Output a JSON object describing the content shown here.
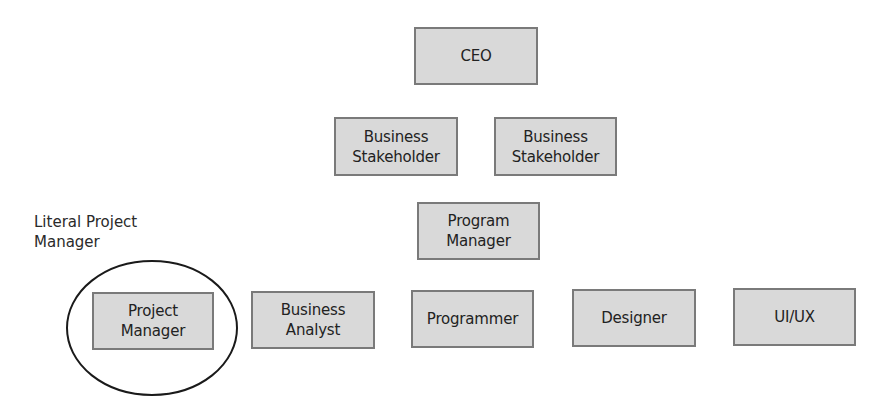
{
  "diagram": {
    "type": "org-chart",
    "nodes": {
      "ceo": {
        "label": "CEO"
      },
      "stakeholder_1": {
        "label": "Business\nStakeholder"
      },
      "stakeholder_2": {
        "label": "Business\nStakeholder"
      },
      "program_manager": {
        "label": "Program\nManager"
      },
      "project_manager": {
        "label": "Project\nManager"
      },
      "business_analyst": {
        "label": "Business\nAnalyst"
      },
      "programmer": {
        "label": "Programmer"
      },
      "designer": {
        "label": "Designer"
      },
      "ui_ux": {
        "label": "UI/UX"
      }
    },
    "annotation": {
      "label": "Literal Project\nManager",
      "highlights": "project_manager",
      "shape": "ellipse"
    },
    "rows": [
      [
        "ceo"
      ],
      [
        "stakeholder_1",
        "stakeholder_2"
      ],
      [
        "program_manager"
      ],
      [
        "project_manager",
        "business_analyst",
        "programmer",
        "designer",
        "ui_ux"
      ]
    ],
    "colors": {
      "node_fill": "#d9d9d9",
      "node_border": "#7a7a7a",
      "text": "#222222",
      "ellipse_stroke": "#1a1a1a"
    }
  }
}
